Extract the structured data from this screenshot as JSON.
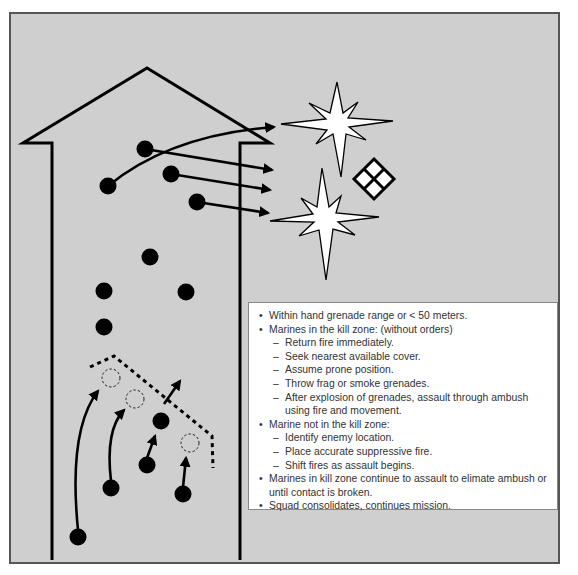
{
  "diagram": {
    "colors": {
      "background": "#cfcfcf",
      "frame_border": "#555555",
      "ink": "#000000",
      "explosion_fill": "#ffffff",
      "textbox_bg": "#ffffff",
      "text": "#333333"
    },
    "building": {
      "shape": "house-outline",
      "roof_apex": [
        147,
        68
      ],
      "left_eave": [
        23,
        143
      ],
      "right_eave": [
        270,
        143
      ],
      "left_wall_x": 52,
      "right_wall_x": 240,
      "wall_bottom_y": 560
    },
    "symbols": {
      "explosions": [
        {
          "name": "explosion-top",
          "center": [
            337,
            127
          ]
        },
        {
          "name": "explosion-bottom",
          "center": [
            322,
            222
          ]
        }
      ],
      "enemy_position": {
        "name": "enemy-diamond-icon",
        "center": [
          374,
          179
        ]
      }
    },
    "marines_firing": [
      {
        "dot": [
          108,
          186
        ],
        "arrow_to": [
          274,
          127
        ],
        "curved": true
      },
      {
        "dot": [
          145,
          149
        ],
        "arrow_to": [
          272,
          170
        ]
      },
      {
        "dot": [
          171,
          174
        ],
        "arrow_to": [
          270,
          190
        ]
      },
      {
        "dot": [
          197,
          202
        ],
        "arrow_to": [
          268,
          213
        ]
      }
    ],
    "marines_static": [
      {
        "dot": [
          150,
          257
        ]
      },
      {
        "dot": [
          104,
          291
        ]
      },
      {
        "dot": [
          186,
          292
        ]
      },
      {
        "dot": [
          104,
          327
        ]
      }
    ],
    "assault_line": {
      "style": "dashed",
      "points": [
        [
          90,
          367
        ],
        [
          114,
          356
        ],
        [
          212,
          436
        ],
        [
          213,
          468
        ]
      ]
    },
    "assault_moves": [
      {
        "from": [
          78,
          537
        ],
        "to": [
          98,
          391
        ],
        "end_marker": "dashed-circle",
        "marker_at": [
          111,
          378
        ]
      },
      {
        "from": [
          111,
          488
        ],
        "to": [
          124,
          410
        ],
        "end_marker": "dashed-circle",
        "marker_at": [
          135,
          399
        ]
      },
      {
        "from": [
          147,
          465
        ],
        "to": [
          155,
          436
        ],
        "end_marker": "filled-dot",
        "marker_at": [
          161,
          421
        ]
      },
      {
        "from": [
          183,
          494
        ],
        "to": [
          186,
          458
        ],
        "end_marker": "dashed-circle",
        "marker_at": [
          190,
          443
        ]
      }
    ],
    "shift_fire_arrow": {
      "from": [
        164,
        404
      ],
      "to": [
        180,
        381
      ]
    }
  },
  "textbox": {
    "items": [
      {
        "text": "Within hand grenade range or < 50 meters.",
        "sub": []
      },
      {
        "text": "Marines in the kill zone: (without orders)",
        "sub": [
          "Return fire immediately.",
          "Seek nearest available cover.",
          "Assume prone position.",
          "Throw frag or smoke grenades.",
          "After explosion of grenades, assault through ambush using fire and movement."
        ]
      },
      {
        "text": "Marine not in the kill zone:",
        "sub": [
          "Identify enemy location.",
          "Place accurate suppressive fire.",
          "Shift fires as assault begins."
        ]
      },
      {
        "text": "Marines in kill zone continue to assault to elimate ambush or until contact is broken.",
        "sub": []
      },
      {
        "text": "Squad consolidates, continues mission.",
        "sub": []
      }
    ]
  }
}
